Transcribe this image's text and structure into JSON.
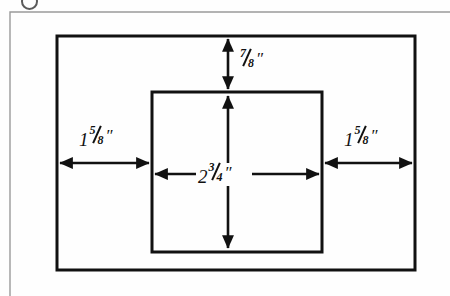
{
  "figure": {
    "name": "dimensioned-rectangle-diagram",
    "background_color": "#fefefe",
    "line_color": "#111111",
    "page_frame_color": "#9a9a9a"
  },
  "shapes": {
    "outer_rectangle": {
      "name": "outer-rectangle",
      "x": 57,
      "y": 36,
      "width": 358,
      "height": 234,
      "stroke_width": 3
    },
    "inner_rectangle": {
      "name": "inner-rectangle",
      "x": 152,
      "y": 92,
      "width": 170,
      "height": 160,
      "stroke_width": 3
    },
    "page_frame": {
      "name": "page-frame",
      "x": 10,
      "y": 12,
      "width": 440,
      "height": 284,
      "stroke_width": 1
    }
  },
  "dimensions": [
    {
      "id": "top-gap",
      "name": "dimension-top-gap",
      "whole": "",
      "numerator": "7",
      "denominator": "8",
      "unit": "″",
      "text": "7/8″",
      "orientation": "vertical",
      "arrow_style": "double-headed",
      "from": {
        "x": 228,
        "y": 36
      },
      "to": {
        "x": 228,
        "y": 92
      },
      "label_position": {
        "x": 239,
        "y": 49
      }
    },
    {
      "id": "left-gap",
      "name": "dimension-left-gap",
      "whole": "1",
      "numerator": "5",
      "denominator": "8",
      "unit": "″",
      "text": "1 5/8″",
      "orientation": "horizontal",
      "arrow_style": "double-headed",
      "from": {
        "x": 57,
        "y": 163
      },
      "to": {
        "x": 152,
        "y": 163
      },
      "label_position": {
        "x": 79,
        "y": 126
      }
    },
    {
      "id": "right-gap",
      "name": "dimension-right-gap",
      "whole": "1",
      "numerator": "5",
      "denominator": "8",
      "unit": "″",
      "text": "1 5/8″",
      "orientation": "horizontal",
      "arrow_style": "double-headed",
      "from": {
        "x": 322,
        "y": 163
      },
      "to": {
        "x": 415,
        "y": 163
      },
      "label_position": {
        "x": 344,
        "y": 126
      }
    },
    {
      "id": "inner-width",
      "name": "dimension-inner-width",
      "whole": "2",
      "numerator": "3",
      "denominator": "4",
      "unit": "″",
      "text": "2 3/4″",
      "orientation": "horizontal",
      "arrow_style": "double-headed",
      "from": {
        "x": 152,
        "y": 174
      },
      "to": {
        "x": 322,
        "y": 174
      },
      "label_position": {
        "x": 196,
        "y": 163
      }
    },
    {
      "id": "inner-height-upper",
      "name": "dimension-inner-height-upper",
      "orientation": "vertical",
      "arrow_style": "single-headed-up",
      "from": {
        "x": 228,
        "y": 168
      },
      "to": {
        "x": 228,
        "y": 93
      }
    },
    {
      "id": "inner-height-lower",
      "name": "dimension-inner-height-lower",
      "orientation": "vertical",
      "arrow_style": "single-headed-down",
      "from": {
        "x": 228,
        "y": 186
      },
      "to": {
        "x": 228,
        "y": 251
      }
    }
  ]
}
